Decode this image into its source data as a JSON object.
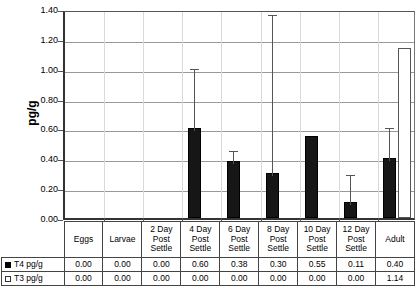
{
  "chart_data": {
    "type": "bar",
    "title": "",
    "subtitle": "",
    "xlabel": "",
    "ylabel": "pg/g",
    "ylim": [
      0.0,
      1.4
    ],
    "ytick_labels": [
      "0.00",
      "0.20",
      "0.40",
      "0.60",
      "0.80",
      "1.00",
      "1.20",
      "1.40"
    ],
    "ytick_values": [
      0.0,
      0.2,
      0.4,
      0.6,
      0.8,
      1.0,
      1.2,
      1.4
    ],
    "grid": true,
    "legend_position": "table-row-labels",
    "categories": [
      "Eggs",
      "Larvae",
      "2 Day Post Settle",
      "4 Day Post Settle",
      "6 Day Post Settle",
      "8 Day Post Settle",
      "10 Day Post Settle",
      "12 Day Post Settle",
      "Adult"
    ],
    "category_lines": [
      [
        "Eggs"
      ],
      [
        "Larvae"
      ],
      [
        "2 Day",
        "Post",
        "Settle"
      ],
      [
        "4 Day",
        "Post",
        "Settle"
      ],
      [
        "6 Day",
        "Post",
        "Settle"
      ],
      [
        "8 Day",
        "Post",
        "Settle"
      ],
      [
        "10 Day",
        "Post",
        "Settle"
      ],
      [
        "12 Day",
        "Post",
        "Settle"
      ],
      [
        "Adult"
      ]
    ],
    "series": [
      {
        "name": "T4 pg/g",
        "marker": "filled-square",
        "color": "#161616",
        "values": [
          0.0,
          0.0,
          0.0,
          0.6,
          0.38,
          0.3,
          0.55,
          0.11,
          0.4
        ],
        "labels": [
          "0.00",
          "0.00",
          "0.00",
          "0.60",
          "0.38",
          "0.30",
          "0.55",
          "0.11",
          "0.40"
        ],
        "error_upper": [
          0.0,
          0.0,
          0.0,
          1.02,
          0.47,
          1.38,
          0.55,
          0.31,
          0.62
        ]
      },
      {
        "name": "T3 pg/g",
        "marker": "open-square",
        "color": "#ffffff",
        "values": [
          0.0,
          0.0,
          0.0,
          0.0,
          0.0,
          0.0,
          0.0,
          0.0,
          1.14
        ],
        "labels": [
          "0.00",
          "0.00",
          "0.00",
          "0.00",
          "0.00",
          "0.00",
          "0.00",
          "0.00",
          "1.14"
        ],
        "error_upper": [
          0.0,
          0.0,
          0.0,
          0.0,
          0.0,
          0.0,
          0.0,
          0.0,
          0.0
        ]
      }
    ]
  }
}
